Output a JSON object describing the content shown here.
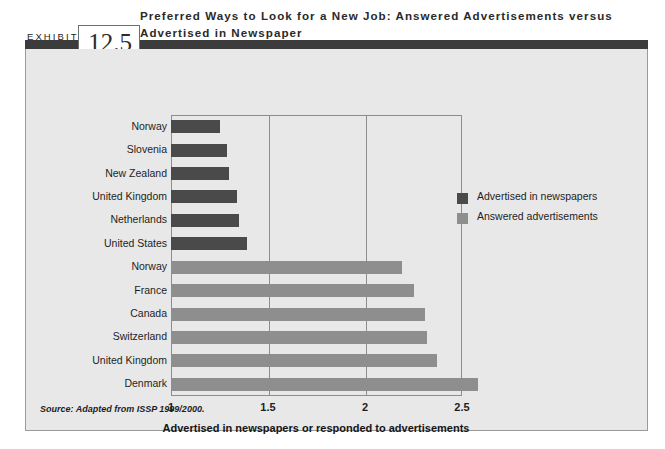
{
  "exhibit": {
    "word": "EXHIBIT",
    "number": "12.5",
    "title": "Preferred Ways to Look for a New Job: Answered Advertisements versus Advertised in Newspaper",
    "source": "Source:  Adapted from ISSP 1999/2000."
  },
  "legend": {
    "position": "right",
    "items": [
      {
        "label": "Advertised in newspapers",
        "color": "#4a4a4a",
        "swatch": "dark-swatch"
      },
      {
        "label": "Answered advertisements",
        "color": "#8e8e8e",
        "swatch": "light-swatch"
      }
    ]
  },
  "chart_data": {
    "type": "bar",
    "orientation": "horizontal",
    "title": "Preferred Ways to Look for a New Job: Answered Advertisements versus Advertised in Newspaper",
    "xlabel": "Advertised in newspapers or responded to advertisements",
    "ylabel": "",
    "xlim": [
      1,
      2.5
    ],
    "xticks": [
      "1",
      "1.5",
      "2",
      "2.5"
    ],
    "xtickvalues": [
      1,
      1.5,
      2,
      2.5
    ],
    "grid": true,
    "grid_axis": "x",
    "legend": [
      "Advertised in newspapers",
      "Answered advertisements"
    ],
    "categories": [
      "Norway",
      "Slovenia",
      "New Zealand",
      "United Kingdom",
      "Netherlands",
      "United States",
      "Norway",
      "France",
      "Canada",
      "Switzerland",
      "United Kingdom",
      "Denmark"
    ],
    "series": [
      {
        "name": "Advertised in newspapers",
        "color": "#4a4a4a",
        "points": [
          {
            "category": "Norway",
            "value": 1.25
          },
          {
            "category": "Slovenia",
            "value": 1.29
          },
          {
            "category": "New Zealand",
            "value": 1.3
          },
          {
            "category": "United Kingdom",
            "value": 1.34
          },
          {
            "category": "Netherlands",
            "value": 1.35
          },
          {
            "category": "United States",
            "value": 1.39
          }
        ]
      },
      {
        "name": "Answered advertisements",
        "color": "#8e8e8e",
        "points": [
          {
            "category": "Norway",
            "value": 2.19
          },
          {
            "category": "France",
            "value": 2.25
          },
          {
            "category": "Canada",
            "value": 2.31
          },
          {
            "category": "Switzerland",
            "value": 2.32
          },
          {
            "category": "United Kingdom",
            "value": 2.37
          },
          {
            "category": "Denmark",
            "value": 2.58
          }
        ]
      }
    ],
    "source": "Source:  Adapted from ISSP 1999/2000."
  },
  "colors": {
    "panel_background": "#e8e8e8",
    "header_rule": "#3c3c3c",
    "plot_border": "#8d8d8d",
    "dark_series": "#4a4a4a",
    "light_series": "#8e8e8e"
  }
}
